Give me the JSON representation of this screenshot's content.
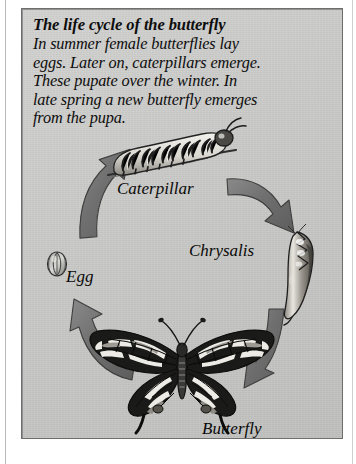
{
  "document": {
    "kind": "printed-diagram-page",
    "background_color": "#ffffff",
    "panel_color": "#c8c8c6",
    "ink_color": "#0d0d0d",
    "arrow_color": "#6f6f6f"
  },
  "heading": {
    "title": "The life cycle of the butterfly"
  },
  "body": {
    "lines": [
      "In summer female butterflies lay",
      "eggs. Later on, caterpillars emerge.",
      "These pupate over the winter. In",
      "late spring a new butterfly emerges",
      "from the pupa."
    ],
    "full_text": "In summer female butterflies lay eggs. Later on, caterpillars emerge. These pupate over the winter. In late spring a new butterfly emerges from the pupa."
  },
  "diagram": {
    "type": "cycle",
    "stages": [
      {
        "id": "caterpillar",
        "label": "Caterpillar",
        "illustration": "caterpillar-illustration",
        "position": "top"
      },
      {
        "id": "chrysalis",
        "label": "Chrysalis",
        "illustration": "chrysalis-illustration",
        "position": "right"
      },
      {
        "id": "butterfly",
        "label": "Butterfly",
        "illustration": "butterfly-illustration",
        "position": "bottom"
      },
      {
        "id": "egg",
        "label": "Egg",
        "illustration": "egg-illustration",
        "position": "left"
      }
    ],
    "arrows": [
      {
        "id": "arrow-egg-to-caterpillar",
        "from": "egg",
        "to": "caterpillar",
        "direction": "up-right"
      },
      {
        "id": "arrow-caterpillar-to-chrysalis",
        "from": "caterpillar",
        "to": "chrysalis",
        "direction": "down-right"
      },
      {
        "id": "arrow-chrysalis-to-butterfly",
        "from": "chrysalis",
        "to": "butterfly",
        "direction": "down-left"
      },
      {
        "id": "arrow-butterfly-to-egg",
        "from": "butterfly",
        "to": "egg",
        "direction": "up-left"
      }
    ]
  }
}
